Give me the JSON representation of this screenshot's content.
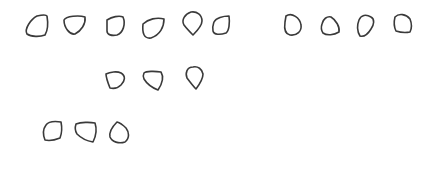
{
  "canvas": {
    "width": 436,
    "height": 194,
    "background": "#ffffff",
    "stroke_color": "#3a3a3a"
  },
  "groups": [
    {
      "name": "row-1-left",
      "count": 6,
      "shapes": [
        {
          "id": "s1",
          "kind": "rounded-quadrilateral",
          "d": "M27,34 C24,29 31,19 37,16 C41,15 46,14 47,16 C48,22 48,30 45,35 C40,37 31,37 27,34 Z"
        },
        {
          "id": "s2",
          "kind": "rounded-pentagon",
          "d": "M64,20 C66,16 79,15 85,17 C86,24 81,31 75,34 C70,35 64,28 64,20 Z"
        },
        {
          "id": "s3",
          "kind": "rounded-square",
          "d": "M107,20 C112,17 119,15 123,17 C126,24 123,33 117,35 C112,36 107,35 107,31 Z"
        },
        {
          "id": "s4",
          "kind": "rounded-quadrilateral",
          "d": "M143,24 C148,19 157,17 164,19 C164,27 160,35 151,38 C144,39 142,33 143,24 Z"
        },
        {
          "id": "s5",
          "kind": "teardrop",
          "d": "M191,12 C185,14 181,20 184,25 C187,29 190,32 193,35 C197,31 202,25 202,21 C202,15 197,11 191,12 Z"
        },
        {
          "id": "s6",
          "kind": "rounded-square",
          "d": "M214,22 C216,18 223,16 229,16 C230,23 229,31 226,33 C220,35 214,35 213,31 C212,27 213,25 214,22 Z"
        }
      ]
    },
    {
      "name": "row-1-right",
      "count": 4,
      "shapes": [
        {
          "id": "s7",
          "kind": "d-shape",
          "d": "M286,16 C292,12 300,18 301,25 C302,31 297,36 290,35 C285,34 284,29 285,22 Z"
        },
        {
          "id": "s8",
          "kind": "rounded-pentagon",
          "d": "M322,24 C323,19 327,16 331,17 C336,20 340,27 339,32 C334,35 327,36 323,33 C321,30 321,27 322,24 Z"
        },
        {
          "id": "s9",
          "kind": "rounded-quadrilateral",
          "d": "M359,20 C361,15 366,14 371,17 C375,19 374,25 371,29 C368,34 364,37 360,36 C357,31 357,25 359,20 Z"
        },
        {
          "id": "s10",
          "kind": "rounded-pentagon",
          "d": "M395,17 C399,13 406,14 410,19 C412,24 412,28 410,32 C405,33 399,32 396,31 C394,27 394,21 395,17 Z"
        }
      ]
    },
    {
      "name": "row-2",
      "count": 3,
      "shapes": [
        {
          "id": "s11",
          "kind": "rounded-pentagon",
          "d": "M106,74 C110,72 117,71 121,73 C126,76 125,81 121,85 C118,88 114,89 110,88 C108,83 106,78 106,74 Z"
        },
        {
          "id": "s12",
          "kind": "rounded-quadrilateral",
          "d": "M144,73 C146,71 155,71 161,72 C164,77 162,84 158,90 C153,88 147,84 144,79 C143,77 143,75 144,73 Z"
        },
        {
          "id": "s13",
          "kind": "teardrop",
          "d": "M193,67 C187,67 185,73 187,78 C190,82 193,86 196,89 C199,85 203,79 203,74 C202,69 198,66 193,67 Z"
        }
      ]
    },
    {
      "name": "row-3",
      "count": 3,
      "shapes": [
        {
          "id": "s14",
          "kind": "rounded-square",
          "d": "M46,125 C48,122 54,121 61,122 C62,127 62,133 60,138 C55,140 49,141 45,140 C43,135 43,129 46,125 Z"
        },
        {
          "id": "s15",
          "kind": "rounded-pentagon",
          "d": "M76,124 C81,122 90,122 95,123 C97,129 96,136 93,142 C87,141 81,138 77,134 C75,131 75,127 76,124 Z"
        },
        {
          "id": "s16",
          "kind": "teardrop",
          "d": "M117,122 C113,126 109,132 110,137 C112,142 119,144 125,142 C130,138 129,132 126,128 C123,125 121,123 117,122 Z"
        }
      ]
    }
  ],
  "total_shapes": 16
}
